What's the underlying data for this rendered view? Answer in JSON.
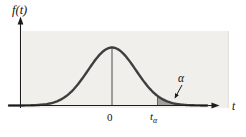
{
  "figure": {
    "y_axis_label": "f(t)",
    "x_axis_label": "t",
    "origin_label": "0",
    "critical_value": {
      "base": "t",
      "sub": "α"
    },
    "tail_area_label": "α"
  },
  "colors": {
    "panel": "#f0efec",
    "panel_edge": "#dedcd8",
    "curve": "#3e3e3e",
    "axis": "#1c1c1c",
    "shade": "#a0a09e",
    "shade_edge": "#4a4a4a",
    "text": "#111111",
    "page": "#ffffff"
  },
  "curve": {
    "center_x": 112,
    "sigma": 24,
    "peak_height": 58,
    "axis_y": 105.5,
    "x_start": 9,
    "x_end": 207,
    "shade_from_x": 157.5,
    "shade_to_x": 203.5
  }
}
